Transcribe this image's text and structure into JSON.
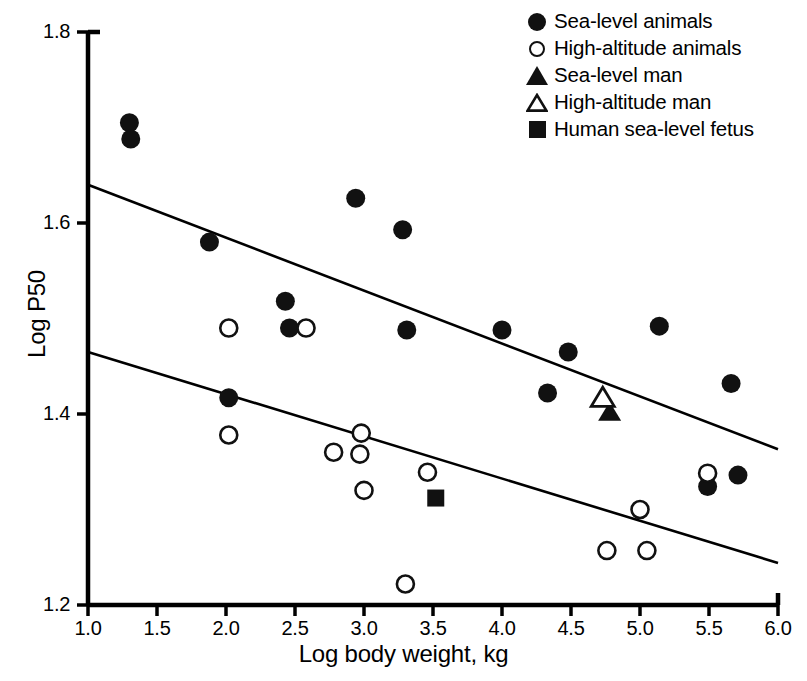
{
  "chart_data": {
    "type": "scatter",
    "title": "",
    "xlabel": "Log body weight, kg",
    "ylabel": "Log P50",
    "xlim": [
      1.0,
      6.0
    ],
    "ylim": [
      1.2,
      1.8
    ],
    "xticks": [
      "1.0",
      "1.5",
      "2.0",
      "2.5",
      "3.0",
      "3.5",
      "4.0",
      "4.5",
      "5.0",
      "5.5",
      "6.0"
    ],
    "yticks": [
      "1.2",
      "1.4",
      "1.6",
      "1.8"
    ],
    "xtick_values": [
      1.0,
      1.5,
      2.0,
      2.5,
      3.0,
      3.5,
      4.0,
      4.5,
      5.0,
      5.5,
      6.0
    ],
    "ytick_values": [
      1.2,
      1.4,
      1.6,
      1.8
    ],
    "grid": false,
    "legend_position": "top-right",
    "series": [
      {
        "name": "Sea-level animals",
        "marker": "filled-circle",
        "color": "#111111",
        "points": [
          [
            1.3,
            1.705
          ],
          [
            1.31,
            1.688
          ],
          [
            1.88,
            1.58
          ],
          [
            2.02,
            1.417
          ],
          [
            2.43,
            1.518
          ],
          [
            2.46,
            1.49
          ],
          [
            2.94,
            1.626
          ],
          [
            3.28,
            1.593
          ],
          [
            3.31,
            1.488
          ],
          [
            4.0,
            1.488
          ],
          [
            4.33,
            1.422
          ],
          [
            4.48,
            1.465
          ],
          [
            5.14,
            1.492
          ],
          [
            5.49,
            1.324
          ],
          [
            5.66,
            1.432
          ],
          [
            5.71,
            1.336
          ]
        ]
      },
      {
        "name": "High-altitude animals",
        "marker": "open-circle",
        "color": "#111111",
        "points": [
          [
            2.02,
            1.49
          ],
          [
            2.02,
            1.378
          ],
          [
            2.58,
            1.49
          ],
          [
            2.78,
            1.36
          ],
          [
            2.97,
            1.358
          ],
          [
            2.98,
            1.38
          ],
          [
            3.0,
            1.32
          ],
          [
            3.3,
            1.222
          ],
          [
            3.46,
            1.339
          ],
          [
            4.76,
            1.257
          ],
          [
            5.0,
            1.3
          ],
          [
            5.05,
            1.257
          ],
          [
            5.49,
            1.338
          ]
        ]
      },
      {
        "name": "Sea-level man",
        "marker": "filled-triangle",
        "color": "#111111",
        "points": [
          [
            4.78,
            1.403
          ]
        ]
      },
      {
        "name": "High-altitude man",
        "marker": "open-triangle",
        "color": "#111111",
        "points": [
          [
            4.73,
            1.418
          ]
        ]
      },
      {
        "name": "Human sea-level fetus",
        "marker": "filled-square",
        "color": "#111111",
        "points": [
          [
            3.52,
            1.312
          ]
        ]
      }
    ],
    "trendlines": [
      {
        "name": "sea-level-regression",
        "x": [
          1.0,
          6.0
        ],
        "y": [
          1.64,
          1.363
        ]
      },
      {
        "name": "high-altitude-regression",
        "x": [
          1.0,
          6.0
        ],
        "y": [
          1.465,
          1.244
        ]
      }
    ]
  },
  "legend": {
    "items": [
      {
        "label": "Sea-level animals",
        "marker": "filled-circle",
        "icon": "filled-circle-icon"
      },
      {
        "label": "High-altitude animals",
        "marker": "open-circle",
        "icon": "open-circle-icon"
      },
      {
        "label": "Sea-level man",
        "marker": "filled-triangle",
        "icon": "filled-triangle-icon"
      },
      {
        "label": "High-altitude man",
        "marker": "open-triangle",
        "icon": "open-triangle-icon"
      },
      {
        "label": "Human sea-level fetus",
        "marker": "filled-square",
        "icon": "filled-square-icon"
      }
    ]
  },
  "colors": {
    "marker": "#111111",
    "axis": "#000000",
    "background": "#ffffff"
  }
}
